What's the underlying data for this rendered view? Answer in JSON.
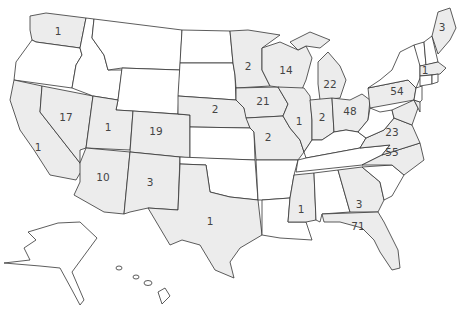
{
  "map": {
    "type": "choropleth",
    "region": "United States",
    "shaded_color": "#ececec",
    "unshaded_color": "#ffffff",
    "border_color": "#333333"
  },
  "states": [
    {
      "code": "WA",
      "value": "1",
      "shaded": true
    },
    {
      "code": "OR",
      "value": "",
      "shaded": false
    },
    {
      "code": "CA",
      "value": "1",
      "shaded": true
    },
    {
      "code": "NV",
      "value": "17",
      "shaded": true
    },
    {
      "code": "ID",
      "value": "",
      "shaded": false
    },
    {
      "code": "MT",
      "value": "",
      "shaded": false
    },
    {
      "code": "WY",
      "value": "",
      "shaded": false
    },
    {
      "code": "UT",
      "value": "1",
      "shaded": true
    },
    {
      "code": "CO",
      "value": "19",
      "shaded": true
    },
    {
      "code": "AZ",
      "value": "10",
      "shaded": true
    },
    {
      "code": "NM",
      "value": "3",
      "shaded": true
    },
    {
      "code": "ND",
      "value": "",
      "shaded": false
    },
    {
      "code": "SD",
      "value": "",
      "shaded": false
    },
    {
      "code": "NE",
      "value": "2",
      "shaded": true
    },
    {
      "code": "KS",
      "value": "",
      "shaded": false
    },
    {
      "code": "OK",
      "value": "",
      "shaded": false
    },
    {
      "code": "TX",
      "value": "1",
      "shaded": true
    },
    {
      "code": "MN",
      "value": "2",
      "shaded": true
    },
    {
      "code": "IA",
      "value": "21",
      "shaded": true
    },
    {
      "code": "MO",
      "value": "2",
      "shaded": true
    },
    {
      "code": "AR",
      "value": "",
      "shaded": false
    },
    {
      "code": "LA",
      "value": "",
      "shaded": false
    },
    {
      "code": "WI",
      "value": "14",
      "shaded": true
    },
    {
      "code": "IL",
      "value": "1",
      "shaded": true
    },
    {
      "code": "MI",
      "value": "22",
      "shaded": true
    },
    {
      "code": "IN",
      "value": "2",
      "shaded": true
    },
    {
      "code": "OH",
      "value": "48",
      "shaded": true
    },
    {
      "code": "KY",
      "value": "",
      "shaded": false
    },
    {
      "code": "TN",
      "value": "",
      "shaded": false
    },
    {
      "code": "MS",
      "value": "1",
      "shaded": true
    },
    {
      "code": "AL",
      "value": "",
      "shaded": false
    },
    {
      "code": "GA",
      "value": "3",
      "shaded": true
    },
    {
      "code": "FL",
      "value": "71",
      "shaded": true
    },
    {
      "code": "SC",
      "value": "",
      "shaded": false
    },
    {
      "code": "NC",
      "value": "55",
      "shaded": true
    },
    {
      "code": "VA",
      "value": "23",
      "shaded": true
    },
    {
      "code": "WV",
      "value": "",
      "shaded": false
    },
    {
      "code": "PA",
      "value": "54",
      "shaded": true
    },
    {
      "code": "NY",
      "value": "",
      "shaded": false
    },
    {
      "code": "MD",
      "value": "",
      "shaded": true
    },
    {
      "code": "DE",
      "value": "",
      "shaded": true
    },
    {
      "code": "NJ",
      "value": "",
      "shaded": false
    },
    {
      "code": "CT",
      "value": "",
      "shaded": false
    },
    {
      "code": "RI",
      "value": "",
      "shaded": false
    },
    {
      "code": "MA",
      "value": "1",
      "shaded": true
    },
    {
      "code": "VT",
      "value": "",
      "shaded": false
    },
    {
      "code": "NH",
      "value": "",
      "shaded": false
    },
    {
      "code": "ME",
      "value": "3",
      "shaded": true
    },
    {
      "code": "AK",
      "value": "",
      "shaded": false
    },
    {
      "code": "HI",
      "value": "",
      "shaded": false
    }
  ]
}
